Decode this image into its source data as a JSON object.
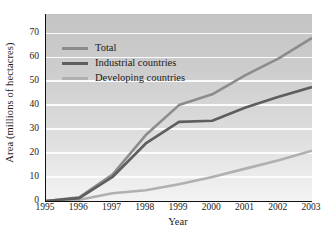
{
  "chart_data": {
    "type": "line",
    "title": "",
    "xlabel": "Year",
    "ylabel": "Area (millions of hectacres)",
    "x": [
      1995,
      1996,
      1997,
      1998,
      1999,
      2000,
      2001,
      2002,
      2003
    ],
    "categories": [
      "1995",
      "1996",
      "1997",
      "1998",
      "1999",
      "2000",
      "2001",
      "2002",
      "2003"
    ],
    "xlim": [
      1995,
      2003
    ],
    "ylim": [
      0,
      78
    ],
    "yticks": [
      0,
      10,
      20,
      30,
      40,
      50,
      60,
      70
    ],
    "ytick_labels": [
      "0",
      "10",
      "20",
      "30",
      "40",
      "50",
      "60",
      "70"
    ],
    "grid": "horizontal",
    "legend_position": "upper-left-inside",
    "series": [
      {
        "name": "Total",
        "color": "#8c8c8c",
        "values": [
          0,
          1.5,
          11.0,
          27.5,
          40.0,
          44.5,
          52.5,
          59.5,
          68.0
        ]
      },
      {
        "name": "Industrial countries",
        "color": "#5e5e5e",
        "values": [
          0,
          1.2,
          10.0,
          24.0,
          33.0,
          33.5,
          39.0,
          43.5,
          47.5
        ]
      },
      {
        "name": "Developing countries",
        "color": "#b0b0b0",
        "values": [
          0,
          0.5,
          3.2,
          4.5,
          7.0,
          10.0,
          13.5,
          17.0,
          21.0
        ]
      }
    ]
  },
  "legend": {
    "items": [
      {
        "label": "Total"
      },
      {
        "label": "Industrial countries"
      },
      {
        "label": "Developing countries"
      }
    ]
  },
  "axes": {
    "x_title": "Year",
    "y_title": "Area (millions of hectacres)"
  }
}
